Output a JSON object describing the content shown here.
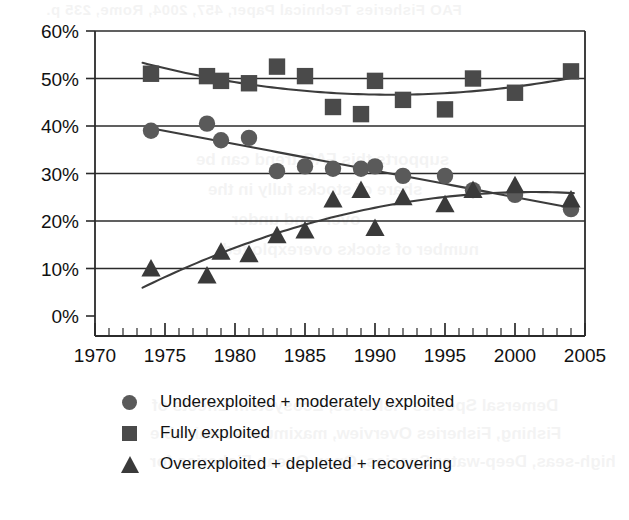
{
  "page": {
    "background_color": "#ffffff",
    "ghost_text": {
      "top_line": "FAO Fisheries Technical Paper, 457, 2004, Rome, 235 p.",
      "mid_line_1": "supports this FAO trend can be",
      "mid_line_2": "share of stocks fully in the",
      "mid_line_3": "over- and under",
      "mid_line_4": "number of stocks overexploited",
      "bottom_line_1": "Demersal Species Fisheries, Ecosystem Effects of",
      "bottom_line_2": "Fishing, Fisheries Overview, maximum sustainable",
      "bottom_line_3": "high-seas, Deep-water Species, Open Ocean Fisheries for"
    }
  },
  "chart_data": {
    "type": "scatter",
    "title": "",
    "subtitle": "",
    "xlabel": "",
    "ylabel": "",
    "xlim": [
      1970,
      2005
    ],
    "ylim": [
      0,
      60
    ],
    "grid": true,
    "grid_axis": "y",
    "legend_position": "bottom",
    "x_ticks": [
      1970,
      1975,
      1980,
      1985,
      1990,
      1995,
      2000,
      2005
    ],
    "x_tick_labels": [
      "1970",
      "1975",
      "1980",
      "1985",
      "1990",
      "1995",
      "2000",
      "2005"
    ],
    "x_minor_tick_interval": 1,
    "y_ticks": [
      0,
      10,
      20,
      30,
      40,
      50,
      60
    ],
    "y_tick_labels": [
      "0%",
      "10%",
      "20%",
      "30%",
      "40%",
      "50%",
      "60%"
    ],
    "x": [
      1974,
      1978,
      1979,
      1981,
      1983,
      1985,
      1987,
      1989,
      1990,
      1992,
      1995,
      1997,
      2000,
      2004
    ],
    "series": [
      {
        "name": "Underexploited + moderately exploited",
        "marker": "circle",
        "color": "#5a5a5a",
        "trendline": "linear",
        "values": [
          39,
          40.5,
          37,
          37.5,
          30.5,
          31.5,
          31,
          31,
          31.5,
          29.5,
          29.5,
          26.5,
          25.5,
          22.5
        ]
      },
      {
        "name": "Fully exploited",
        "marker": "square",
        "color": "#4a4a4a",
        "trendline": "polynomial",
        "values": [
          51,
          50.5,
          49.5,
          49,
          52.5,
          50.5,
          44,
          42.5,
          49.5,
          45.5,
          43.5,
          50,
          47,
          51.5
        ]
      },
      {
        "name": "Overexploited + depleted + recovering",
        "marker": "triangle",
        "color": "#3a3a3a",
        "trendline": "polynomial",
        "values": [
          10,
          8.5,
          13.5,
          13,
          17,
          18,
          24.5,
          26.5,
          18.5,
          25,
          23.5,
          26.5,
          27.5,
          24.5
        ]
      }
    ]
  },
  "legend": {
    "items": [
      {
        "label": "Underexploited + moderately exploited",
        "marker": "circle"
      },
      {
        "label": "Fully exploited",
        "marker": "square"
      },
      {
        "label": "Overexploited + depleted + recovering",
        "marker": "triangle"
      }
    ]
  }
}
